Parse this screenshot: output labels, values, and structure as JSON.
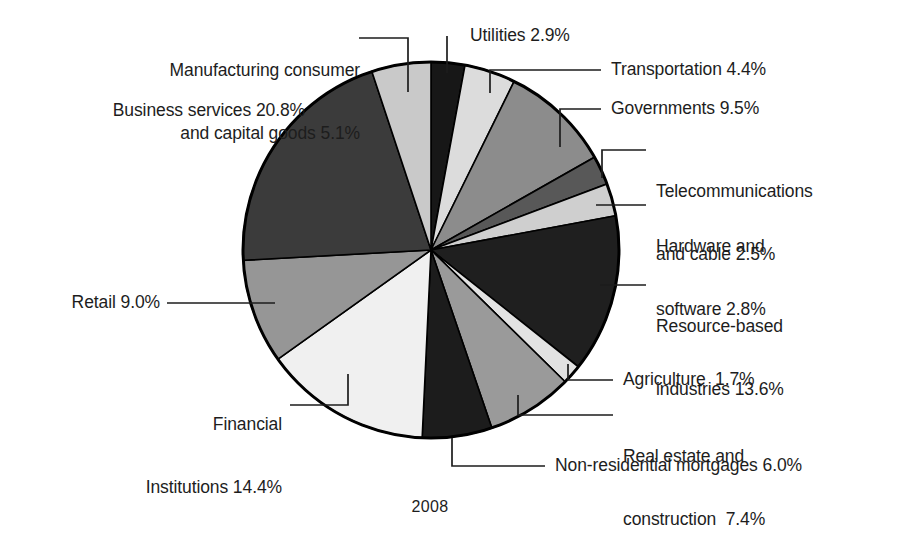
{
  "chart_data": {
    "type": "pie",
    "title": "",
    "subtitle": "",
    "xlabel": "",
    "ylabel": "",
    "caption": "2008",
    "legend_position": "callout-labels",
    "grid": false,
    "units": "percent",
    "total": 100.1,
    "start_angle_deg": 0,
    "direction": "clockwise",
    "categories": [
      "Utilities",
      "Transportation",
      "Governments",
      "Telecommunications and cable",
      "Hardware and software",
      "Resource-based industries",
      "Agriculture",
      "Real estate and construction",
      "Non-residential mortgages",
      "Financial Institutions",
      "Retail",
      "Business services",
      "Manufacturing consumer and capital goods"
    ],
    "values": [
      2.9,
      4.4,
      9.5,
      2.5,
      2.8,
      13.6,
      1.7,
      7.4,
      6.0,
      14.4,
      9.0,
      20.8,
      5.1
    ],
    "slice_colors": [
      "#171717",
      "#dcdcdc",
      "#8c8c8c",
      "#585858",
      "#cfcfcf",
      "#1f1f1f",
      "#e2e2e2",
      "#9a9a9a",
      "#1c1c1c",
      "#f0f0f0",
      "#969696",
      "#3b3b3b",
      "#c9c9c9"
    ],
    "slices": [
      {
        "label": "Utilities",
        "value": 2.9,
        "value_text": "2.9%",
        "color": "#171717"
      },
      {
        "label": "Transportation",
        "value": 4.4,
        "value_text": "4.4%",
        "color": "#dcdcdc"
      },
      {
        "label": "Governments",
        "value": 9.5,
        "value_text": "9.5%",
        "color": "#8c8c8c"
      },
      {
        "label": "Telecommunications and cable",
        "value": 2.5,
        "value_text": "2.5%",
        "color": "#585858"
      },
      {
        "label": "Hardware and software",
        "value": 2.8,
        "value_text": "2.8%",
        "color": "#cfcfcf"
      },
      {
        "label": "Resource-based industries",
        "value": 13.6,
        "value_text": "13.6%",
        "color": "#1f1f1f"
      },
      {
        "label": "Agriculture",
        "value": 1.7,
        "value_text": "1.7%",
        "color": "#e2e2e2"
      },
      {
        "label": "Real estate and construction",
        "value": 7.4,
        "value_text": "7.4%",
        "color": "#9a9a9a"
      },
      {
        "label": "Non-residential mortgages",
        "value": 6.0,
        "value_text": "6.0%",
        "color": "#1c1c1c"
      },
      {
        "label": "Financial Institutions",
        "value": 14.4,
        "value_text": "14.4%",
        "color": "#f0f0f0"
      },
      {
        "label": "Retail",
        "value": 9.0,
        "value_text": "9.0%",
        "color": "#969696"
      },
      {
        "label": "Business services",
        "value": 20.8,
        "value_text": "20.8%",
        "color": "#3b3b3b"
      },
      {
        "label": "Manufacturing consumer and capital goods",
        "value": 5.1,
        "value_text": "5.1%",
        "color": "#c9c9c9"
      }
    ]
  },
  "labels": {
    "manufacturing_line1": "Manufacturing consumer",
    "manufacturing_line2": "and capital goods 5.1%",
    "business_services": "Business services 20.8%",
    "retail": "Retail 9.0%",
    "financial_line1": "Financial",
    "financial_line2": "Institutions 14.4%",
    "utilities": "Utilities 2.9%",
    "transportation": "Transportation 4.4%",
    "governments": "Governments 9.5%",
    "telecom_line1": "Telecommunications",
    "telecom_line2": "and cable 2.5%",
    "hardware_line1": "Hardware and",
    "hardware_line2": "software 2.8%",
    "resource_line1": "Resource-based",
    "resource_line2": "industries 13.6%",
    "agriculture": "Agriculture  1.7%",
    "realestate_line1": "Real estate and",
    "realestate_line2": "construction  7.4%",
    "mortgages": "Non-residential mortgages 6.0%",
    "year": "2008"
  },
  "style": {
    "background": "#ffffff",
    "outline": "#000000",
    "text": "#1d1d1d"
  }
}
